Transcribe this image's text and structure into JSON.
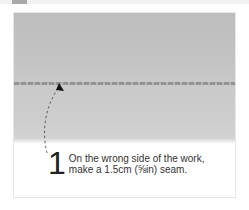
{
  "instruction": {
    "step_number": "1",
    "line1": "On the wrong side of the work,",
    "line2": "make a 1.5cm (⅝in) seam."
  },
  "illustration": {
    "subject": "fabric-seam-photo",
    "annotation": "dashed-arrow-to-seam"
  }
}
